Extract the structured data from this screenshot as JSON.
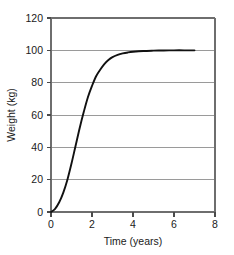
{
  "chart_data": {
    "type": "line",
    "title": "",
    "xlabel": "Time (years)",
    "ylabel": "Weight (kg)",
    "xlim": [
      0,
      8
    ],
    "ylim": [
      0,
      120
    ],
    "xticks": [
      0,
      2,
      4,
      6,
      8
    ],
    "yticks": [
      0,
      20,
      40,
      60,
      80,
      100,
      120
    ],
    "xtick_labels": [
      "0",
      "2",
      "4",
      "6",
      "8"
    ],
    "ytick_labels": [
      "0",
      "20",
      "40",
      "60",
      "80",
      "100",
      "120"
    ],
    "grid": "horizontal",
    "legend": "none",
    "series": [
      {
        "name": "Weight",
        "color": "#111111",
        "x": [
          0,
          0.2,
          0.4,
          0.6,
          0.8,
          1.0,
          1.2,
          1.4,
          1.6,
          1.8,
          2.0,
          2.2,
          2.4,
          2.6,
          2.8,
          3.0,
          3.25,
          3.5,
          3.75,
          4.0,
          4.5,
          5.0,
          5.5,
          6.0,
          6.5,
          7.0
        ],
        "y": [
          0,
          2,
          6,
          12,
          20,
          30,
          41,
          52,
          62,
          71,
          78,
          84,
          88,
          91.5,
          94,
          95.8,
          97.2,
          98.1,
          98.7,
          99.1,
          99.6,
          99.8,
          99.9,
          100,
          100,
          100
        ]
      }
    ],
    "annotations": []
  },
  "axis": {
    "x_title": "Time (years)",
    "y_title": "Weight (kg)"
  }
}
